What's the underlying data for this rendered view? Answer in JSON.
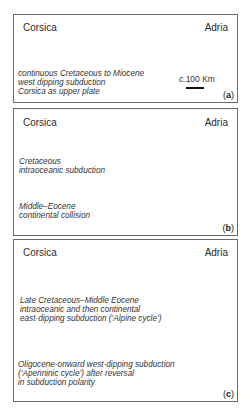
{
  "figure": {
    "panels": [
      {
        "id": "a",
        "tag": "a",
        "left_label": "Corsica",
        "right_label": "Adria",
        "caption": [
          "continuous Cretaceous to Miocene",
          "west dipping subduction",
          "Corsica as upper plate"
        ],
        "scale": {
          "prefix": "c.",
          "value": "100 Km"
        }
      },
      {
        "id": "b",
        "tag": "b",
        "left_label": "Corsica",
        "right_label": "Adria",
        "stages": [
          {
            "caption": [
              "Cretaceous",
              "intraoceanic subduction"
            ]
          },
          {
            "caption": [
              "Middle–Eocene",
              "continental collision"
            ]
          }
        ]
      },
      {
        "id": "c",
        "tag": "c",
        "left_label": "Corsica",
        "right_label": "Adria",
        "stages": [
          {
            "caption": [
              "Late Cretaceous–Middle Eocene",
              "intraoceanic and then continental",
              "east-dipping subduction (‘Alpine cycle’)"
            ]
          },
          {
            "caption": [
              "Oligocene-onward west-dipping subduction",
              "(‘Apenninic cycle’)  after reversal",
              "in subduction polarity"
            ]
          }
        ]
      }
    ],
    "colors": {
      "slab": "#111111",
      "wedge": "#9a9a9a",
      "wedge_light": "#d4d4d4",
      "hatch": "#333333",
      "frame": "#6a6a6a"
    }
  }
}
